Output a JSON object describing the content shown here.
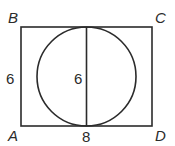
{
  "diagram": {
    "type": "geometry",
    "shapes": [
      "rectangle ABCD",
      "inscribed circle",
      "vertical diameter"
    ],
    "vertices": {
      "A": "A",
      "B": "B",
      "C": "C",
      "D": "D"
    },
    "measurements": {
      "side_AB": "6",
      "diameter": "6",
      "side_AD": "8"
    },
    "colors": {
      "stroke": "#2b2b2b",
      "background": "#ffffff"
    }
  }
}
